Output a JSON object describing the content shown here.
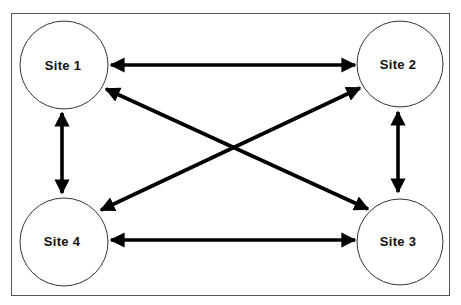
{
  "diagram": {
    "type": "network",
    "frame": {
      "x": 11,
      "y": 13,
      "width": 439,
      "height": 283,
      "stroke": "#555555"
    },
    "colors": {
      "node_stroke": "#333333",
      "arrow": "#000000",
      "background": "#ffffff"
    },
    "nodes": [
      {
        "id": "site1",
        "label": "Site 1",
        "cx": 64,
        "cy": 65,
        "r": 44
      },
      {
        "id": "site2",
        "label": "Site 2",
        "cx": 400,
        "cy": 64,
        "r": 43
      },
      {
        "id": "site3",
        "label": "Site 3",
        "cx": 400,
        "cy": 242,
        "r": 43
      },
      {
        "id": "site4",
        "label": "Site 4",
        "cx": 64,
        "cy": 242,
        "r": 44
      }
    ],
    "edges": [
      {
        "from": "site1",
        "to": "site2",
        "bidirectional": true
      },
      {
        "from": "site1",
        "to": "site4",
        "bidirectional": true
      },
      {
        "from": "site2",
        "to": "site3",
        "bidirectional": true
      },
      {
        "from": "site4",
        "to": "site3",
        "bidirectional": true
      },
      {
        "from": "site1",
        "to": "site3",
        "bidirectional": true
      },
      {
        "from": "site2",
        "to": "site4",
        "bidirectional": true
      }
    ]
  }
}
